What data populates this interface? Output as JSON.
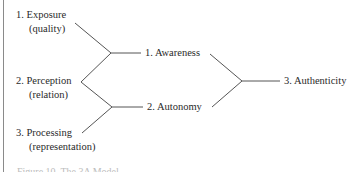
{
  "diagram": {
    "inputs": [
      {
        "label": "1.  Exposure",
        "sub": "(quality)"
      },
      {
        "label": "2.  Perception",
        "sub": "(relation)"
      },
      {
        "label": "3.  Processing",
        "sub": "(representation)"
      }
    ],
    "middle": [
      {
        "label": "1. Awareness"
      },
      {
        "label": "2.  Autonomy"
      }
    ],
    "output": {
      "label": "3. Authenticity"
    }
  },
  "caption": {
    "text": "Figure 10. The 3A Model"
  },
  "colors": {
    "line": "#555555",
    "text": "#2a2a2a",
    "border": "#8a8a8a"
  }
}
